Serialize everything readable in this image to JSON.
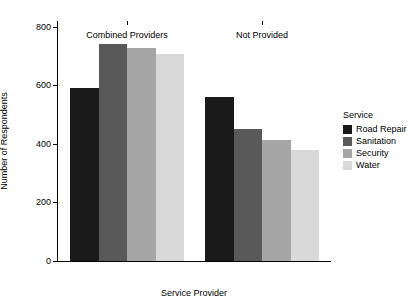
{
  "chart_data": {
    "type": "bar",
    "title": "",
    "xlabel": "Service Provider",
    "ylabel": "Number of Respondents",
    "categories": [
      "Combined Providers",
      "Not Provided"
    ],
    "series": [
      {
        "name": "Road Repair",
        "color": "#1a1a1a",
        "values": [
          590,
          562
        ]
      },
      {
        "name": "Sanitation",
        "color": "#595959",
        "values": [
          740,
          452
        ]
      },
      {
        "name": "Security",
        "color": "#a6a6a6",
        "values": [
          728,
          412
        ]
      },
      {
        "name": "Water",
        "color": "#d9d9d9",
        "values": [
          708,
          378
        ]
      }
    ],
    "ylim": [
      0,
      820
    ],
    "yticks": [
      0,
      200,
      400,
      600,
      800
    ],
    "ytick_labels": [
      "0",
      "200",
      "400",
      "600",
      "800"
    ],
    "grid": false,
    "legend_position": "right",
    "legend_title": "Service"
  },
  "axes": {
    "x_title": "Service Provider",
    "y_title": "Number of Respondents"
  },
  "legend": {
    "title": "Service",
    "entries": [
      {
        "label": "Road Repair",
        "color": "#1a1a1a"
      },
      {
        "label": "Sanitation",
        "color": "#595959"
      },
      {
        "label": "Security",
        "color": "#a6a6a6"
      },
      {
        "label": "Water",
        "color": "#d9d9d9"
      }
    ]
  }
}
